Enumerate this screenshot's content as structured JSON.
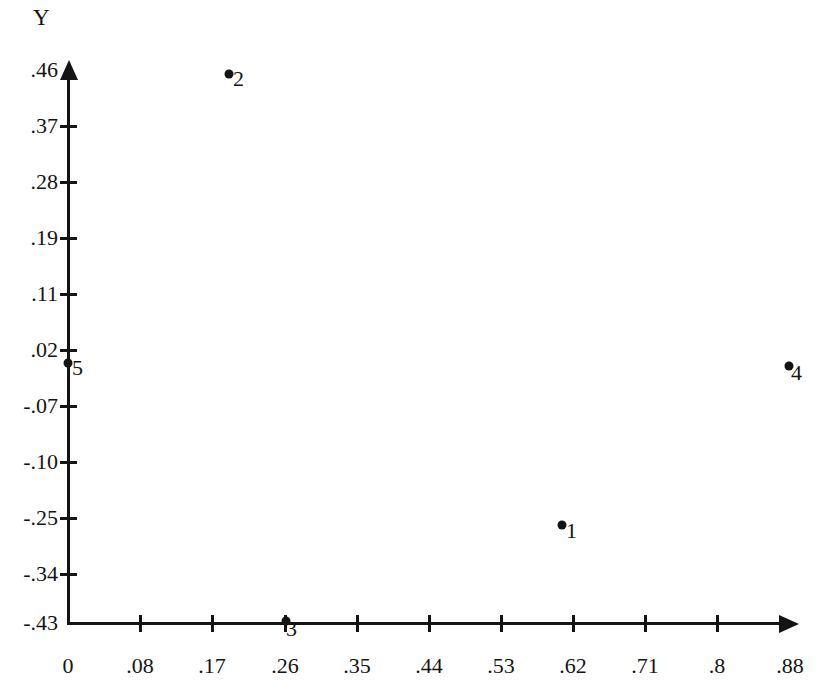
{
  "chart_data": {
    "type": "scatter",
    "title": "",
    "xlabel": "",
    "ylabel": "Y",
    "grid": false,
    "legend": null,
    "xlim": [
      0,
      0.88
    ],
    "ylim": [
      -0.43,
      0.46
    ],
    "x_tick_labels": [
      "0",
      ".08",
      ".17",
      ".26",
      ".35",
      ".44",
      ".53",
      ".62",
      ".71",
      ".8",
      ".88"
    ],
    "x_tick_values": [
      0,
      0.08,
      0.17,
      0.26,
      0.35,
      0.44,
      0.53,
      0.62,
      0.71,
      0.8,
      0.88
    ],
    "y_tick_labels": [
      ".46",
      ".37",
      ".28",
      ".19",
      ".11",
      ".02",
      "-.07",
      "-.10",
      "-.25",
      "-.34",
      "-.43"
    ],
    "y_tick_values": [
      0.46,
      0.37,
      0.28,
      0.19,
      0.11,
      0.02,
      -0.07,
      -0.1,
      -0.25,
      -0.34,
      -0.43
    ],
    "point_labels": [
      "1",
      "2",
      "3",
      "4",
      "5"
    ],
    "points": [
      {
        "label": "1",
        "x": 0.59,
        "y": -0.27
      },
      {
        "label": "2",
        "x": 0.18,
        "y": 0.45
      },
      {
        "label": "3",
        "x": 0.24,
        "y": -0.43
      },
      {
        "label": "4",
        "x": 0.87,
        "y": 0.0
      },
      {
        "label": "5",
        "x": 0.0,
        "y": 0.0
      }
    ],
    "marker_color": "#141414",
    "axis_color": "#141414",
    "background_color": "#ffffff"
  },
  "axes": {
    "y_title": "Y"
  },
  "y_ticks": [
    {
      "label": ".46",
      "top": 70,
      "tick": false
    },
    {
      "label": ".37",
      "top": 126,
      "tick": true
    },
    {
      "label": ".28",
      "top": 182,
      "tick": true
    },
    {
      "label": ".19",
      "top": 238,
      "tick": true
    },
    {
      "label": ".11",
      "top": 294,
      "tick": true
    },
    {
      "label": ".02",
      "top": 350,
      "tick": true
    },
    {
      "label": "-.07",
      "top": 406,
      "tick": true
    },
    {
      "label": "-.10",
      "top": 462,
      "tick": true
    },
    {
      "label": "-.25",
      "top": 518,
      "tick": true
    },
    {
      "label": "-.34",
      "top": 574,
      "tick": true
    },
    {
      "label": "-.43",
      "top": 623,
      "tick": false
    }
  ],
  "x_ticks": [
    {
      "label": "0",
      "left": 68,
      "tick": false
    },
    {
      "label": ".08",
      "left": 140,
      "tick": true
    },
    {
      "label": ".17",
      "left": 212,
      "tick": true
    },
    {
      "label": ".26",
      "left": 285,
      "tick": true
    },
    {
      "label": ".35",
      "left": 357,
      "tick": true
    },
    {
      "label": ".44",
      "left": 429,
      "tick": true
    },
    {
      "label": ".53",
      "left": 501,
      "tick": true
    },
    {
      "label": ".62",
      "left": 573,
      "tick": true
    },
    {
      "label": ".71",
      "left": 645,
      "tick": true
    },
    {
      "label": ".8",
      "left": 717,
      "tick": true
    },
    {
      "label": ".88",
      "left": 790,
      "tick": false
    }
  ],
  "plot_points": [
    {
      "label": "2",
      "cx": 229,
      "cy": 74,
      "label_left": 233,
      "label_top": 68
    },
    {
      "label": "5",
      "cx": 68,
      "cy": 363,
      "label_left": 72,
      "label_top": 357
    },
    {
      "label": "4",
      "cx": 789,
      "cy": 366,
      "label_left": 791,
      "label_top": 362
    },
    {
      "label": "1",
      "cx": 562,
      "cy": 525,
      "label_left": 566,
      "label_top": 520
    },
    {
      "label": "3",
      "cx": 286,
      "cy": 621,
      "label_left": 286,
      "label_top": 618
    }
  ]
}
